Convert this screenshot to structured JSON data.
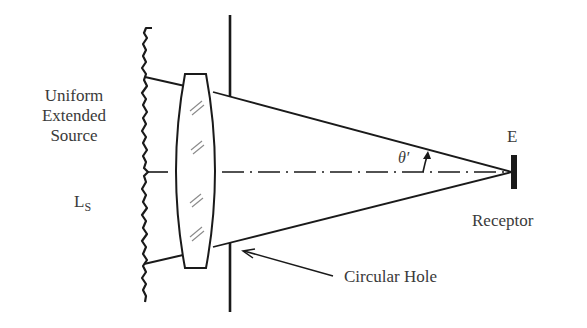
{
  "diagram": {
    "type": "optical-radiometry-schematic",
    "labels": {
      "source_line1": "Uniform",
      "source_line2": "Extended",
      "source_line3": "Source",
      "radiance_main": "L",
      "radiance_sub": "S",
      "irradiance": "E",
      "receptor": "Receptor",
      "angle": "θ′",
      "aperture": "Circular Hole"
    },
    "elements": [
      "uniform-extended-source (wavy vertical line)",
      "lens (biconvex)",
      "aperture plate with circular hole",
      "optical axis (dash-dot)",
      "marginal rays converging to receptor",
      "receptor",
      "half-angle theta-prime arc arrow",
      "pointer arrow to circular hole"
    ],
    "colors": {
      "ink": "#1a1a1a",
      "text": "#3a3a3a",
      "hatch": "#8a8a8a",
      "background": "#ffffff"
    }
  }
}
